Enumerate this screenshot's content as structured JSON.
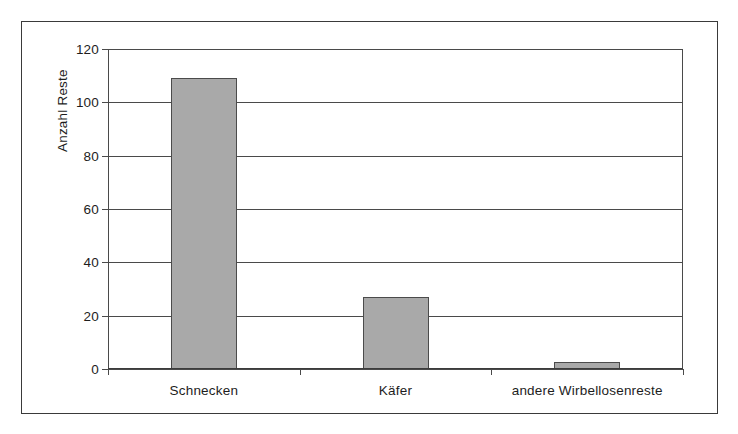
{
  "chart_data": {
    "type": "bar",
    "title": "",
    "xlabel": "",
    "ylabel": "Anzahl Reste",
    "categories": [
      "Schnecken",
      "Käfer",
      "andere Wirbellosenreste"
    ],
    "values": [
      109,
      27,
      2.5
    ],
    "ylim": [
      0,
      120
    ],
    "yticks": [
      0,
      20,
      40,
      60,
      80,
      100,
      120
    ],
    "ytick_labels": [
      "0",
      "20",
      "40",
      "60",
      "80",
      "100",
      "120"
    ],
    "grid": "horizontal",
    "legend": "none",
    "bar_color": "#a9a9a9",
    "bar_edge_color": "#4b4b4b",
    "axis_color": "#4a4a4a",
    "background": "#ffffff",
    "frame_border_color": "#3a3a3a"
  }
}
